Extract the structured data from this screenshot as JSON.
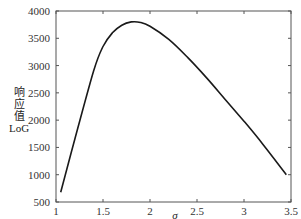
{
  "chart_data": {
    "type": "line",
    "title": "",
    "xlabel": "σ",
    "ylabel": "LoG响应值",
    "ylabel_lines": [
      "响",
      "应",
      "值",
      "LoG"
    ],
    "xlim": [
      1,
      3.5
    ],
    "ylim": [
      500,
      4000
    ],
    "xticks": [
      1,
      1.5,
      2,
      2.5,
      3,
      3.5
    ],
    "xtick_labels": [
      "1",
      "1.5",
      "2",
      "2.5",
      "3",
      "3.5"
    ],
    "yticks": [
      500,
      1000,
      1500,
      2000,
      2500,
      3000,
      3500,
      4000
    ],
    "ytick_labels": [
      "500",
      "1000",
      "1500",
      "2000",
      "2500",
      "3000",
      "3500",
      "4000"
    ],
    "grid": false,
    "legend": null,
    "series": [
      {
        "name": "LoG response",
        "color": "#1a1a1a",
        "x": [
          1.05,
          1.2,
          1.4,
          1.5,
          1.6,
          1.7,
          1.8,
          1.9,
          2.0,
          2.2,
          2.4,
          2.6,
          2.8,
          3.0,
          3.2,
          3.45
        ],
        "y": [
          680,
          1650,
          2900,
          3350,
          3600,
          3740,
          3800,
          3790,
          3720,
          3480,
          3150,
          2780,
          2380,
          1980,
          1560,
          1000
        ]
      }
    ]
  }
}
